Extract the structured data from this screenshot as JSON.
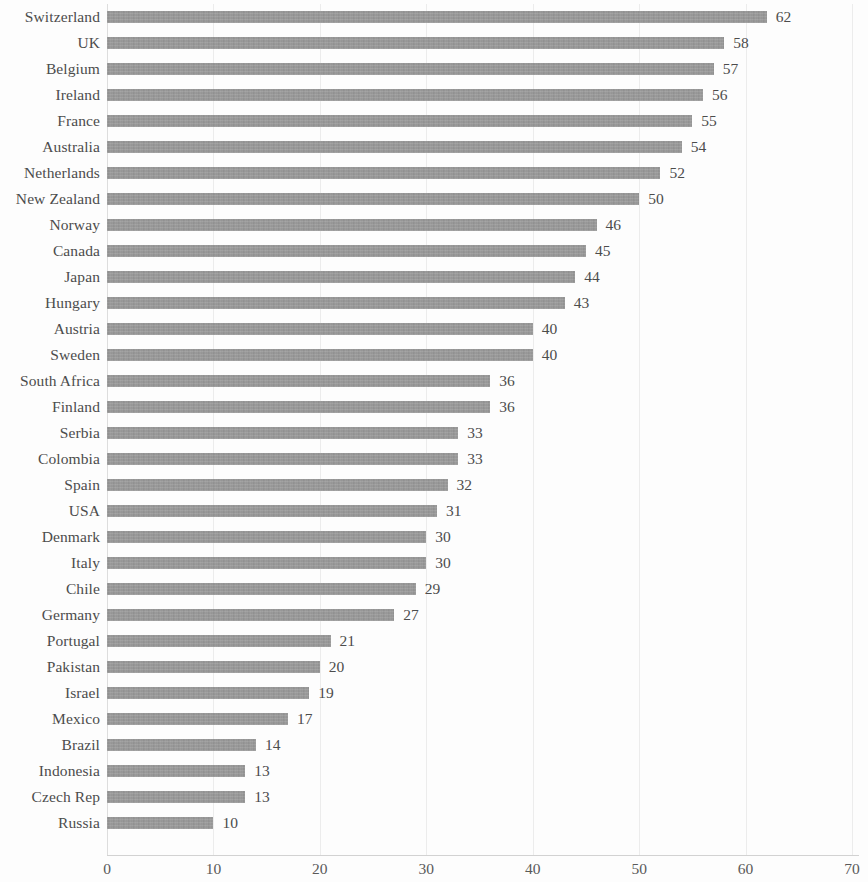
{
  "chart_data": {
    "type": "bar",
    "orientation": "horizontal",
    "title": "",
    "subtitle": "",
    "xlabel": "",
    "ylabel": "",
    "xlim": [
      0,
      70
    ],
    "xticks": [
      "0",
      "10",
      "20",
      "30",
      "40",
      "50",
      "60",
      "70"
    ],
    "grid": true,
    "grid_axis": "x",
    "legend": null,
    "data_labels": true,
    "bar_color": "#969696",
    "background_color": "#ffffff",
    "text_color": "#4c4c4c",
    "gridline_color": "#ececec",
    "categories": [
      "Switzerland",
      "UK",
      "Belgium",
      "Ireland",
      "France",
      "Australia",
      "Netherlands",
      "New Zealand",
      "Norway",
      "Canada",
      "Japan",
      "Hungary",
      "Austria",
      "Sweden",
      "South Africa",
      "Finland",
      "Serbia",
      "Colombia",
      "Spain",
      "USA",
      "Denmark",
      "Italy",
      "Chile",
      "Germany",
      "Portugal",
      "Pakistan",
      "Israel",
      "Mexico",
      "Brazil",
      "Indonesia",
      "Czech Rep",
      "Russia"
    ],
    "values": [
      62,
      58,
      57,
      56,
      55,
      54,
      52,
      50,
      46,
      45,
      44,
      43,
      40,
      40,
      36,
      36,
      33,
      33,
      32,
      31,
      30,
      30,
      29,
      27,
      21,
      20,
      19,
      17,
      14,
      13,
      13,
      10
    ],
    "value_labels": [
      "62",
      "58",
      "57",
      "56",
      "55",
      "54",
      "52",
      "50",
      "46",
      "45",
      "44",
      "43",
      "40",
      "40",
      "36",
      "36",
      "33",
      "33",
      "32",
      "31",
      "30",
      "30",
      "29",
      "27",
      "21",
      "20",
      "19",
      "17",
      "14",
      "13",
      "13",
      "10"
    ]
  }
}
